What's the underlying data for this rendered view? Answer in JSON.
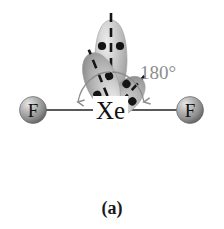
{
  "figure": {
    "caption": "(a)",
    "kind": "molecular-geometry-diagram",
    "molecule": "XeF2",
    "background_color": "#ffffff"
  },
  "atoms": [
    {
      "id": "fluorine-left",
      "label": "F",
      "cx": 33,
      "cy": 110,
      "r": 13,
      "color": "#8a8a8a"
    },
    {
      "id": "xenon-center",
      "label": "Xe",
      "cx": 110,
      "cy": 111,
      "r": 0,
      "color": "#111111"
    },
    {
      "id": "fluorine-right",
      "label": "F",
      "cx": 190,
      "cy": 110,
      "r": 13,
      "color": "#8a8a8a"
    }
  ],
  "bonds": [
    {
      "id": "bond-left",
      "x1": 46,
      "y1": 110,
      "x2": 93,
      "y2": 110
    },
    {
      "id": "bond-right",
      "x1": 128,
      "y1": 110,
      "x2": 177,
      "y2": 110
    }
  ],
  "angle": {
    "label": "180°",
    "value": 180,
    "unit": "degrees",
    "label_x": 140,
    "label_y": 78,
    "color": "#8d8d8d"
  },
  "lone_pairs": [
    {
      "id": "lone-pair-top",
      "orientation": "up",
      "rotation": 0,
      "tip_x": 111,
      "tip_y": 108,
      "length": 78,
      "width": 36,
      "electron_dots": [
        {
          "x": 102,
          "y": 46
        },
        {
          "x": 120,
          "y": 46
        }
      ],
      "axis_x1": 111,
      "axis_y1": 14,
      "axis_x2": 111,
      "axis_y2": 96
    },
    {
      "id": "lone-pair-lower-left",
      "orientation": "down-left",
      "rotation": 222,
      "tip_x": 103,
      "tip_y": 122,
      "length": 56,
      "width": 30,
      "electron_dots": [
        {
          "x": 66,
          "y": 147
        },
        {
          "x": 82,
          "y": 158
        }
      ],
      "axis_x1": 101,
      "axis_y1": 124,
      "axis_x2": 58,
      "axis_y2": 162
    },
    {
      "id": "lone-pair-lower-right",
      "orientation": "down-right",
      "rotation": 158,
      "tip_x": 118,
      "tip_y": 122,
      "length": 72,
      "width": 34,
      "electron_dots": [
        {
          "x": 130,
          "y": 166
        },
        {
          "x": 146,
          "y": 157
        }
      ],
      "axis_x1": 117,
      "axis_y1": 124,
      "axis_x2": 157,
      "axis_y2": 188
    }
  ],
  "colors": {
    "sphere_light": "#dedede",
    "sphere_mid": "#9a9a9a",
    "sphere_dark": "#5d5d5d",
    "lobe_light": "#e6e6e6",
    "lobe_mid": "#b4b4b4",
    "lobe_dark": "#8b8b8b",
    "bond_stroke": "#222222",
    "arc_stroke": "#8d8d8d",
    "text_dark": "#111111"
  }
}
